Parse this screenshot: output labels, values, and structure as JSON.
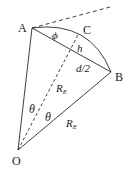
{
  "diagram": {
    "points": {
      "A": {
        "label": "A",
        "x": 32,
        "y": 28
      },
      "B": {
        "label": "B",
        "x": 111,
        "y": 72
      },
      "C": {
        "label": "C",
        "x": 79,
        "y": 33
      },
      "O": {
        "label": "O",
        "x": 18,
        "y": 150
      }
    },
    "labels": {
      "phi": "ϕ",
      "h": "h",
      "half_chord": "d/2",
      "radius_dashed": "R",
      "radius_dashed_sub": "E",
      "radius_ob": "R",
      "radius_ob_sub": "E",
      "theta_left": "θ",
      "theta_right": "θ"
    },
    "colors": {
      "line": "#2a2a2a",
      "text": "#222222"
    }
  }
}
